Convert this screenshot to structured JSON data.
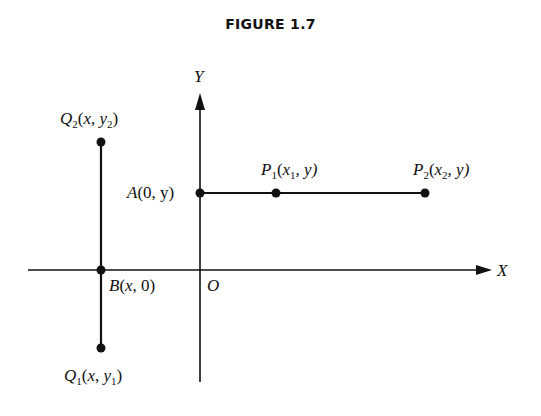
{
  "figure": {
    "title": "FIGURE 1.7"
  },
  "axes": {
    "x_label": "X",
    "y_label": "Y",
    "origin_label": "O"
  },
  "points": {
    "A": {
      "name": "A",
      "coords": "(0, y)"
    },
    "P1": {
      "name": "P",
      "sub": "1",
      "coords_pre": "(",
      "x": "x",
      "x_sub": "1",
      "coords_post": ", y)"
    },
    "P2": {
      "name": "P",
      "sub": "2",
      "coords_pre": "(",
      "x": "x",
      "x_sub": "2",
      "coords_post": ", y)"
    },
    "Q2": {
      "name": "Q",
      "sub": "2",
      "coords_pre": "(",
      "x": "x",
      "mid": ", ",
      "y": "y",
      "y_sub": "2",
      "coords_post": ")"
    },
    "Q1": {
      "name": "Q",
      "sub": "1",
      "coords_pre": "(",
      "x": "x",
      "mid": ", ",
      "y": "y",
      "y_sub": "1",
      "coords_post": ")"
    },
    "B": {
      "name": "B",
      "coords_pre": "(",
      "x": "x",
      "coords_post": ", 0)"
    }
  },
  "colors": {
    "ink": "#111111",
    "background": "#ffffff"
  }
}
